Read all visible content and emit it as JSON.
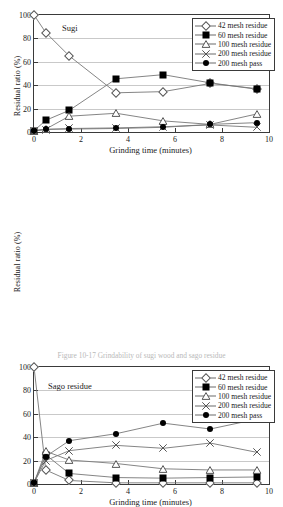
{
  "figure": {
    "caption": "Figure 10-17 Grindability of sugi wood and sago residue"
  },
  "legend": {
    "entries": [
      {
        "label": "42 mesh residue",
        "marker": "open-diamond"
      },
      {
        "label": "60 mesh residue",
        "marker": "filled-square"
      },
      {
        "label": "100 mesh residue",
        "marker": "open-triangle"
      },
      {
        "label": "200 mesh residue",
        "marker": "cross-x"
      },
      {
        "label": "200 mesh pass",
        "marker": "filled-circle"
      }
    ]
  },
  "axes": {
    "ylabel": "Residual ratio (%)",
    "xlabel": "Grinding time (minutes)",
    "yticks": [
      "0",
      "20",
      "40",
      "60",
      "80",
      "100"
    ],
    "xticks": [
      "0",
      "2",
      "4",
      "6",
      "8",
      "10"
    ],
    "ylim": [
      0,
      100
    ],
    "xlim": [
      0,
      10
    ]
  },
  "chart_data": [
    {
      "type": "line",
      "title": "Sugi",
      "xlabel": "Grinding time (minutes)",
      "ylabel": "Residual ratio (%)",
      "xlim": [
        0,
        10
      ],
      "ylim": [
        0,
        100
      ],
      "grid": true,
      "legend_position": "top-right",
      "x": [
        0,
        0.5,
        1.5,
        3.5,
        5.5,
        7.5,
        9.5
      ],
      "series": [
        {
          "name": "42 mesh residue",
          "marker": "open-diamond",
          "values": [
            100,
            85,
            65,
            33.5,
            34.5,
            41.5,
            37
          ]
        },
        {
          "name": "60 mesh residue",
          "marker": "filled-square",
          "values": [
            1,
            10,
            18.5,
            45.5,
            49,
            42,
            36.5
          ]
        },
        {
          "name": "100 mesh residue",
          "marker": "open-triangle",
          "values": [
            1,
            2.5,
            13.5,
            16,
            9.5,
            6.5,
            15.5
          ]
        },
        {
          "name": "200 mesh residue",
          "marker": "cross-x",
          "values": [
            1,
            2,
            3,
            3.5,
            4.5,
            6,
            4
          ]
        },
        {
          "name": "200 mesh pass",
          "marker": "filled-circle",
          "values": [
            1,
            2.5,
            2.5,
            3,
            4,
            6.5,
            8
          ]
        }
      ]
    },
    {
      "type": "line",
      "title": "Sago residue",
      "xlabel": "Grinding time (minutes)",
      "ylabel": "Residual ratio (%)",
      "xlim": [
        0,
        10
      ],
      "ylim": [
        0,
        100
      ],
      "grid": true,
      "legend_position": "top-right",
      "x": [
        0,
        0.5,
        1.5,
        3.5,
        5.5,
        7.5,
        9.5
      ],
      "series": [
        {
          "name": "42 mesh residue",
          "marker": "open-diamond",
          "values": [
            100,
            12,
            3,
            1,
            1,
            1,
            1
          ]
        },
        {
          "name": "60 mesh residue",
          "marker": "filled-square",
          "values": [
            1,
            25,
            9,
            5.5,
            5,
            5.5,
            6
          ]
        },
        {
          "name": "100 mesh residue",
          "marker": "open-triangle",
          "values": [
            1,
            28,
            20.5,
            17.5,
            13,
            12,
            12
          ]
        },
        {
          "name": "200 mesh residue",
          "marker": "cross-x",
          "values": [
            1,
            20,
            28.5,
            33,
            30.5,
            35,
            27
          ]
        },
        {
          "name": "200 mesh pass",
          "marker": "filled-circle",
          "values": [
            1,
            23.5,
            37,
            43,
            52,
            47,
            55.5
          ]
        }
      ]
    }
  ]
}
